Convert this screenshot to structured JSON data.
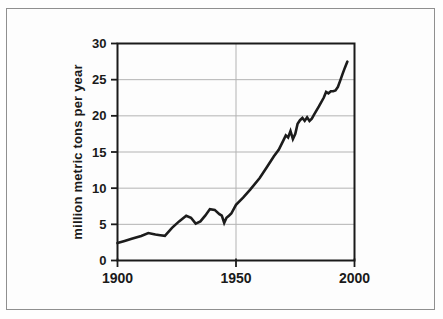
{
  "figure": {
    "background": "#fdfdfd",
    "border_color": "#8f8f8f"
  },
  "chart_data": {
    "type": "line",
    "title": "",
    "xlabel": "",
    "ylabel": "million metric tons per year",
    "xlim": [
      1900,
      2000
    ],
    "ylim": [
      0,
      30
    ],
    "x_ticks": [
      1900,
      1950,
      2000
    ],
    "y_ticks": [
      0,
      5,
      10,
      15,
      20,
      25,
      30
    ],
    "grid": {
      "horizontal_at": [
        5,
        10,
        15,
        20,
        25
      ],
      "vertical_at": [
        1950
      ]
    },
    "axis_color": "#1a1a1a",
    "grid_color": "#b3b3b3",
    "line_color": "#1c1c1c",
    "legend": null,
    "series": [
      {
        "name": "production",
        "x": [
          1900,
          1903,
          1906,
          1910,
          1913,
          1916,
          1918,
          1920,
          1923,
          1926,
          1929,
          1931,
          1933,
          1935,
          1937,
          1939,
          1941,
          1943,
          1944,
          1945,
          1946,
          1947,
          1948,
          1950,
          1953,
          1956,
          1960,
          1963,
          1966,
          1968,
          1970,
          1971,
          1972,
          1973,
          1974,
          1975,
          1976,
          1977,
          1978,
          1979,
          1980,
          1981,
          1982,
          1983,
          1985,
          1987,
          1988,
          1989,
          1990,
          1991,
          1992,
          1993,
          1994,
          1995,
          1996,
          1997
        ],
        "y": [
          2.4,
          2.7,
          3.0,
          3.4,
          3.8,
          3.6,
          3.5,
          3.4,
          4.5,
          5.4,
          6.2,
          5.9,
          5.1,
          5.4,
          6.2,
          7.1,
          7.0,
          6.4,
          6.2,
          5.2,
          5.9,
          6.2,
          6.5,
          7.7,
          8.7,
          9.8,
          11.4,
          12.9,
          14.4,
          15.3,
          16.6,
          17.3,
          17.0,
          17.9,
          16.8,
          17.5,
          18.9,
          19.4,
          19.7,
          19.3,
          19.8,
          19.3,
          19.6,
          20.2,
          21.3,
          22.5,
          23.3,
          23.1,
          23.4,
          23.4,
          23.5,
          24.0,
          24.9,
          25.8,
          26.7,
          27.5
        ]
      }
    ]
  }
}
